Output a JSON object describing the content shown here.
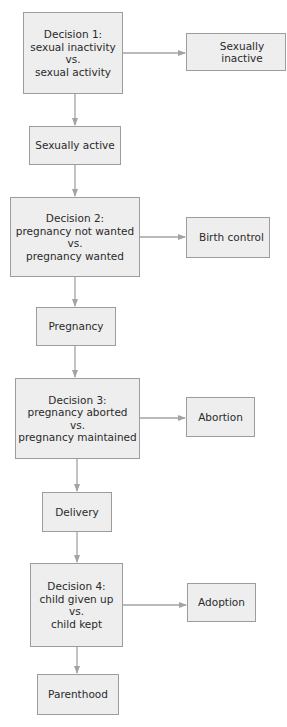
{
  "diagram": {
    "type": "flowchart",
    "colors": {
      "box_fill": "#eeeeee",
      "box_border": "#9c9c9c",
      "arrow": "#a3a3a3",
      "text": "#2a2a2a"
    },
    "decisions": [
      {
        "title": "Decision 1:",
        "option_a": "sexual inactivity",
        "vs": "vs.",
        "option_b": "sexual activity",
        "side_outcome": "Sexually inactive",
        "next": "Sexually active"
      },
      {
        "title": "Decision 2:",
        "option_a": "pregnancy not wanted",
        "vs": "vs.",
        "option_b": "pregnancy wanted",
        "side_outcome": "Birth control",
        "next": "Pregnancy"
      },
      {
        "title": "Decision 3:",
        "option_a": "pregnancy aborted",
        "vs": "vs.",
        "option_b": "pregnancy maintained",
        "side_outcome": "Abortion",
        "next": "Delivery"
      },
      {
        "title": "Decision 4:",
        "option_a": "child given up",
        "vs": "vs.",
        "option_b": "child kept",
        "side_outcome": "Adoption",
        "next": "Parenthood"
      }
    ]
  }
}
